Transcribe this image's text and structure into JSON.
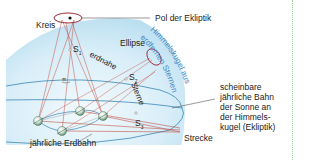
{
  "diagram": {
    "labels": {
      "kreis": "Kreis",
      "pol": "Pol der Ekliptik",
      "ellipse": "Ellipse",
      "erdnahe": "erdnahe",
      "sterne": "Sterne",
      "s1": "S",
      "s1_sub": "1",
      "s2": "S",
      "s2_sub": "2",
      "s3": "S",
      "s3_sub": "3",
      "pi": "π",
      "himmelskugel_line1": "Himmelskugel aus",
      "himmelskugel_line2": "erdfernen Sternen",
      "jaehrliche_erdbahn": "jährliche Erdbahn",
      "strecke": "Strecke",
      "ekliptik_lines": [
        "scheinbare",
        "jährliche Bahn",
        "der Sonne an",
        "der Himmels-",
        "kugel (Ekliptik)"
      ]
    },
    "colors": {
      "sphere_light": "#e4f3fa",
      "sphere_mid": "#bfe2f2",
      "orbit_line": "#3a87b8",
      "ray": "#c0392b",
      "ellipse_stroke": "#9b2c3a",
      "curved_text": "#3a87c8",
      "earth_green": "#7cae8c",
      "border_dot": "#9ccf9c"
    },
    "earth_positions": [
      {
        "x": 38,
        "y": 121
      },
      {
        "x": 62,
        "y": 131
      },
      {
        "x": 80,
        "y": 111
      },
      {
        "x": 103,
        "y": 116
      }
    ]
  }
}
